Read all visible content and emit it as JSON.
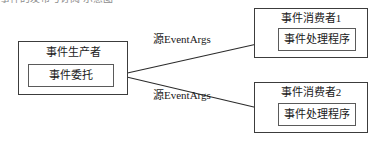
{
  "diagram": {
    "type": "event-flow-diagram",
    "clipped_top_text": "事件的发布与订阅 示意图",
    "producer": {
      "title": "事件生产者",
      "inner": "事件委托"
    },
    "consumers": [
      {
        "title": "事件消费者1",
        "inner": "事件处理程序"
      },
      {
        "title": "事件消费者2",
        "inner": "事件处理程序"
      }
    ],
    "edges": [
      {
        "label": "源EventArgs",
        "from": "事件委托",
        "to": "事件消费者1"
      },
      {
        "label": "源EventArgs",
        "from": "事件委托",
        "to": "事件消费者2"
      }
    ],
    "colors": {
      "background": "#ffffff",
      "outer_border": "#3c3c3c",
      "inner_border": "#5a5a5a",
      "text": "#1a1a1a",
      "arrow": "#2b2b2b"
    }
  }
}
